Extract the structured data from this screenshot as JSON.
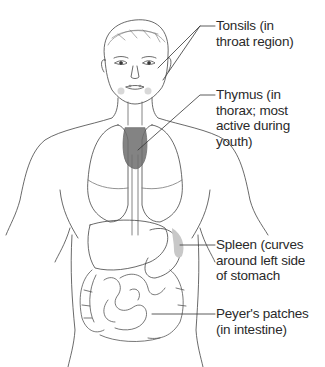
{
  "figure": {
    "accent_colors": {
      "line": "#444444",
      "thymus_fill": "#6e6e6e",
      "spleen_fill": "#c8c8c8"
    }
  },
  "labels": [
    {
      "id": "tonsils",
      "text": "Tonsils (in\nthroat region)"
    },
    {
      "id": "thymus",
      "text": "Thymus (in\nthorax; most\nactive during\nyouth)"
    },
    {
      "id": "spleen",
      "text": "Spleen (curves\naround left side\nof stomach"
    },
    {
      "id": "peyers",
      "text": "Peyer's patches\n(in intestine)"
    }
  ]
}
